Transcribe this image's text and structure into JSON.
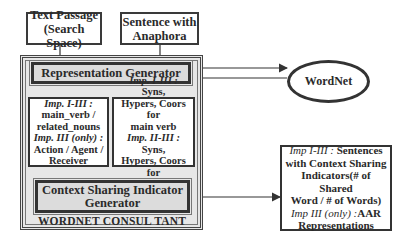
{
  "inputs": {
    "text_passage": {
      "line1": "Text Passage",
      "line2": "(Search Space)"
    },
    "sentence": {
      "line1": "Sentence with",
      "line2": "Anaphora"
    }
  },
  "consultant": {
    "label": "WORDNET CONSUL TANT",
    "representation_generator": "Representation Generator",
    "left_panel": {
      "imp1_label": "Imp. I-III :",
      "imp1_text_a": "main_verb /",
      "imp1_text_b": "related_nouns",
      "imp3_label": "Imp. III (only) :",
      "imp3_text_a": "Action / Agent /",
      "imp3_text_b": "Receiver"
    },
    "right_panel": {
      "imp1_label": "Imp. I-III :",
      "imp1_text_a": " Syns,",
      "imp1_text_b": "Hypers, Coors for",
      "imp1_text_c": "main verb",
      "imp2_label": "Imp. II-III :",
      "imp2_text_a": " Syns,",
      "imp2_text_b": "Hypers, Coors for",
      "imp2_text_c": "related nouns"
    },
    "context_generator": {
      "line1": "Context Sharing Indicator",
      "line2": "Generator"
    }
  },
  "wordnet": {
    "label": "WordNet"
  },
  "output": {
    "imp1_label": "Imp I-III :",
    "imp1_text_a": " Sentences",
    "imp1_text_b": "with Context Sharing",
    "imp1_text_c": "Indicators(# of Shared",
    "imp1_text_d": "Word / # of Words)",
    "imp3_label": "Imp III (only) :",
    "imp3_text_a": "AAR",
    "imp3_text_b": "Representations"
  }
}
